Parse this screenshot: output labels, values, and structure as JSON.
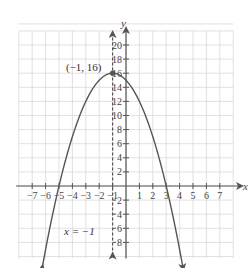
{
  "chart_data": {
    "type": "line",
    "title": "",
    "xlabel": "x",
    "ylabel": "y",
    "xlim": [
      -8,
      8
    ],
    "ylim": [
      -10,
      22
    ],
    "grid": true,
    "x_ticks": [
      -7,
      -6,
      -5,
      -4,
      -3,
      -2,
      -1,
      1,
      2,
      3,
      4,
      5,
      6,
      7
    ],
    "x_tick_labels": [
      "−7",
      "−6",
      "−5",
      "−4",
      "−3",
      "−2",
      "−1",
      "1",
      "2",
      "3",
      "4",
      "5",
      "6",
      "7"
    ],
    "y_ticks": [
      -8,
      -6,
      -4,
      -2,
      2,
      4,
      6,
      8,
      10,
      12,
      14,
      16,
      18,
      20
    ],
    "y_tick_labels": [
      "8",
      "6",
      "4",
      "2",
      "2",
      "4",
      "6",
      "8",
      "10",
      "12",
      "14",
      "16",
      "18",
      "20"
    ],
    "series": [
      {
        "name": "parabola",
        "equation": "y = -(x + 1)^2 + 16",
        "x": [
          -6.3,
          -6,
          -5,
          -4,
          -3,
          -2,
          -1,
          0,
          1,
          2,
          3,
          4,
          4.3
        ],
        "y": [
          -12.09,
          -9,
          0,
          7,
          12,
          15,
          16,
          15,
          12,
          7,
          0,
          -9,
          -12.09
        ],
        "style": "solid",
        "arrows": "both ends"
      },
      {
        "name": "axis of symmetry",
        "equation": "x = -1",
        "x": [
          -1,
          -1
        ],
        "y": [
          -10,
          22
        ],
        "style": "dashed",
        "arrows": "both ends"
      }
    ],
    "annotations": [
      {
        "text": "(−1, 16)",
        "x": -1,
        "y": 16,
        "type": "point label"
      },
      {
        "text": "x = −1",
        "x": -4.3,
        "y": -7,
        "type": "line label"
      }
    ],
    "points": [
      {
        "x": -1,
        "y": 16,
        "label": "(−1, 16)"
      }
    ]
  },
  "labels": {
    "x_axis": "x",
    "y_axis": "y",
    "vertex": "(−1, 16)",
    "symmetry": "x = −1"
  },
  "colors": {
    "grid": "#d9d9d9",
    "axes": "#555555",
    "curve": "#555555",
    "text": "#444444"
  }
}
